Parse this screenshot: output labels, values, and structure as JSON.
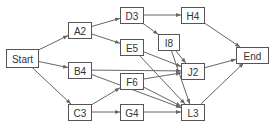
{
  "diagram": {
    "type": "flow-graph",
    "colors": {
      "node_border": "#555555",
      "edge": "#666666",
      "text": "#333333",
      "background": "#ffffff"
    },
    "nodes": [
      {
        "id": "Start",
        "label": "Start",
        "x": 6,
        "y": 49,
        "w": 32,
        "h": 18
      },
      {
        "id": "A2",
        "label": "A2",
        "x": 68,
        "y": 22,
        "w": 23,
        "h": 16
      },
      {
        "id": "D3",
        "label": "D3",
        "x": 120,
        "y": 7,
        "w": 23,
        "h": 16
      },
      {
        "id": "H4",
        "label": "H4",
        "x": 181,
        "y": 7,
        "w": 23,
        "h": 16
      },
      {
        "id": "E5",
        "label": "E5",
        "x": 120,
        "y": 39,
        "w": 23,
        "h": 16
      },
      {
        "id": "I8",
        "label": "I8",
        "x": 158,
        "y": 34,
        "w": 21,
        "h": 16
      },
      {
        "id": "B4",
        "label": "B4",
        "x": 68,
        "y": 62,
        "w": 23,
        "h": 16
      },
      {
        "id": "J2",
        "label": "J2",
        "x": 181,
        "y": 63,
        "w": 23,
        "h": 16
      },
      {
        "id": "End",
        "label": "End",
        "x": 236,
        "y": 47,
        "w": 32,
        "h": 16
      },
      {
        "id": "F6",
        "label": "F6",
        "x": 120,
        "y": 73,
        "w": 23,
        "h": 16
      },
      {
        "id": "C3",
        "label": "C3",
        "x": 68,
        "y": 104,
        "w": 23,
        "h": 16
      },
      {
        "id": "G4",
        "label": "G4",
        "x": 120,
        "y": 104,
        "w": 23,
        "h": 16
      },
      {
        "id": "L3",
        "label": "L3",
        "x": 181,
        "y": 104,
        "w": 23,
        "h": 16
      }
    ],
    "edges": [
      {
        "from": "Start",
        "to": "A2"
      },
      {
        "from": "Start",
        "to": "B4"
      },
      {
        "from": "Start",
        "to": "C3"
      },
      {
        "from": "A2",
        "to": "D3"
      },
      {
        "from": "A2",
        "to": "E5"
      },
      {
        "from": "D3",
        "to": "H4"
      },
      {
        "from": "D3",
        "to": "I8"
      },
      {
        "from": "H4",
        "to": "End"
      },
      {
        "from": "E5",
        "to": "J2"
      },
      {
        "from": "E5",
        "to": "L3"
      },
      {
        "from": "I8",
        "to": "J2"
      },
      {
        "from": "I8",
        "to": "L3"
      },
      {
        "from": "B4",
        "to": "J2"
      },
      {
        "from": "B4",
        "to": "L3"
      },
      {
        "from": "F6",
        "to": "J2"
      },
      {
        "from": "F6",
        "to": "L3"
      },
      {
        "from": "C3",
        "to": "F6"
      },
      {
        "from": "C3",
        "to": "G4"
      },
      {
        "from": "G4",
        "to": "L3"
      },
      {
        "from": "J2",
        "to": "End"
      },
      {
        "from": "L3",
        "to": "End"
      }
    ]
  }
}
